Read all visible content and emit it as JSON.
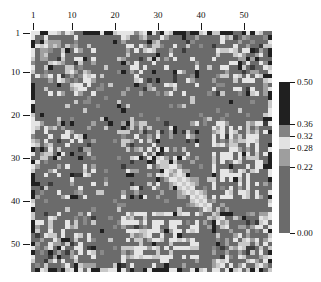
{
  "figure": {
    "type": "heatmap-figure",
    "background": "#ffffff",
    "width": 321,
    "height": 282
  },
  "axes": {
    "top": {
      "name": "column-axis",
      "ticks": [
        1,
        10,
        20,
        30,
        40,
        50
      ],
      "labels": [
        "1",
        "10",
        "20",
        "30",
        "40",
        "50"
      ]
    },
    "left": {
      "name": "row-axis",
      "ticks": [
        1,
        10,
        20,
        30,
        40,
        50
      ],
      "labels": [
        "1",
        "10",
        "20",
        "30",
        "40",
        "50"
      ]
    }
  },
  "colorbar": {
    "name": "colorbar",
    "orientation": "vertical",
    "vmin": 0.0,
    "vmax": 0.5,
    "tick_values": [
      0.5,
      0.36,
      0.32,
      0.28,
      0.22,
      0.0
    ],
    "tick_labels": [
      "0.50",
      "0.36",
      "0.32",
      "0.28",
      "0.22",
      "0.00"
    ],
    "bands": [
      {
        "from": 0.0,
        "to": 0.22,
        "color": "#6b6b6b"
      },
      {
        "from": 0.22,
        "to": 0.28,
        "color": "#9e9e9e"
      },
      {
        "from": 0.28,
        "to": 0.32,
        "color": "#e2e2e2"
      },
      {
        "from": 0.32,
        "to": 0.36,
        "color": "#838383"
      },
      {
        "from": 0.36,
        "to": 0.5,
        "color": "#202020"
      }
    ]
  },
  "chart_data": {
    "type": "heatmap",
    "title": "",
    "xlabel": "",
    "ylabel": "",
    "n_rows": 56,
    "n_cols": 56,
    "xlim": [
      1,
      56
    ],
    "ylim": [
      1,
      56
    ],
    "grid": false,
    "legend_position": "right",
    "colormap": "gray-discrete",
    "vmin": 0.0,
    "vmax": 0.5,
    "xtick_labels": [
      "1",
      "10",
      "20",
      "30",
      "40",
      "50"
    ],
    "ytick_labels": [
      "1",
      "10",
      "20",
      "30",
      "40",
      "50"
    ],
    "colorbar_ticks": [
      0.0,
      0.22,
      0.28,
      0.32,
      0.36,
      0.5
    ],
    "value_levels": {
      "background": 0.15,
      "mid": 0.25,
      "light": 0.3,
      "bright": 0.31,
      "dark": 0.45
    },
    "note": "56x56 symmetric block-structured similarity matrix rendered in discrete grayscale levels; a light diagonal streak runs through the middle-right region and high-contrast dark/light cells line the first and last rows/columns.",
    "values": null
  }
}
